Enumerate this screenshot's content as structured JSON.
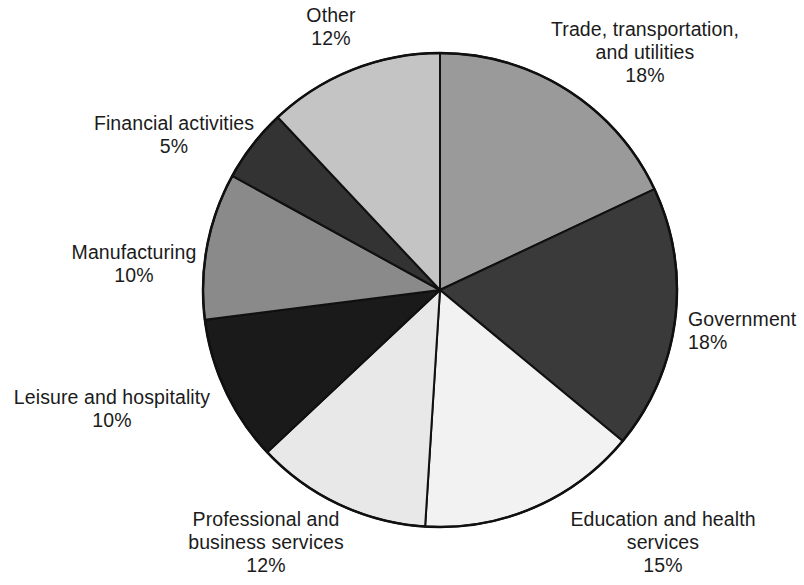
{
  "chart_data": {
    "type": "pie",
    "title": "",
    "subtitle": "",
    "xlabel": "",
    "ylabel": "",
    "units": "percent",
    "legend_position": "none",
    "grid": false,
    "start_angle_deg": 0,
    "direction": "clockwise",
    "center": {
      "x": 440,
      "y": 290
    },
    "radius": 237,
    "categories": [
      "Trade, transportation, and utilities",
      "Government",
      "Education and health services",
      "Professional and business services",
      "Leisure and hospitality",
      "Manufacturing",
      "Financial activities",
      "Other"
    ],
    "values": [
      18,
      18,
      15,
      12,
      10,
      10,
      5,
      12
    ],
    "value_labels": [
      "18%",
      "18%",
      "15%",
      "12%",
      "10%",
      "10%",
      "5%",
      "12%"
    ],
    "colors": [
      "#9a9a9a",
      "#3a3a3a",
      "#f2f2f2",
      "#e8e8e8",
      "#1a1a1a",
      "#8a8a8a",
      "#333333",
      "#c4c4c4"
    ],
    "stroke_color": "#101010",
    "slices": [
      {
        "name": "Trade, transportation, and utilities",
        "label_lines": "Trade, transportation,\nand utilities",
        "percent_label": "18%",
        "value": 18,
        "color": "#9a9a9a",
        "start_deg": 0,
        "end_deg": 64.8,
        "label_pos": {
          "left": 520,
          "top": 18,
          "width": 250,
          "align": "center"
        }
      },
      {
        "name": "Government",
        "label_lines": "Government",
        "percent_label": "18%",
        "value": 18,
        "color": "#3a3a3a",
        "start_deg": 64.8,
        "end_deg": 129.6,
        "label_pos": {
          "left": 688,
          "top": 308,
          "width": 116,
          "align": "left"
        }
      },
      {
        "name": "Education and health services",
        "label_lines": "Education and health\nservices",
        "percent_label": "15%",
        "value": 15,
        "color": "#f2f2f2",
        "start_deg": 129.6,
        "end_deg": 183.6,
        "label_pos": {
          "left": 548,
          "top": 508,
          "width": 230,
          "align": "center"
        }
      },
      {
        "name": "Professional and business services",
        "label_lines": "Professional and\nbusiness services",
        "percent_label": "12%",
        "value": 12,
        "color": "#e8e8e8",
        "start_deg": 183.6,
        "end_deg": 226.8,
        "label_pos": {
          "left": 140,
          "top": 508,
          "width": 252,
          "align": "center"
        }
      },
      {
        "name": "Leisure and hospitality",
        "label_lines": "Leisure and hospitality",
        "percent_label": "10%",
        "value": 10,
        "color": "#1a1a1a",
        "start_deg": 226.8,
        "end_deg": 262.8,
        "label_pos": {
          "left": 6,
          "top": 386,
          "width": 212,
          "align": "center"
        }
      },
      {
        "name": "Manufacturing",
        "label_lines": "Manufacturing",
        "percent_label": "10%",
        "value": 10,
        "color": "#8a8a8a",
        "start_deg": 262.8,
        "end_deg": 298.8,
        "label_pos": {
          "left": 60,
          "top": 241,
          "width": 148,
          "align": "center"
        }
      },
      {
        "name": "Financial activities",
        "label_lines": "Financial activities",
        "percent_label": "5%",
        "value": 5,
        "color": "#333333",
        "start_deg": 298.8,
        "end_deg": 316.8,
        "label_pos": {
          "left": 82,
          "top": 112,
          "width": 184,
          "align": "center"
        }
      },
      {
        "name": "Other",
        "label_lines": "Other",
        "percent_label": "12%",
        "value": 12,
        "color": "#c4c4c4",
        "start_deg": 316.8,
        "end_deg": 360,
        "label_pos": {
          "left": 268,
          "top": 4,
          "width": 126,
          "align": "center"
        }
      }
    ]
  }
}
